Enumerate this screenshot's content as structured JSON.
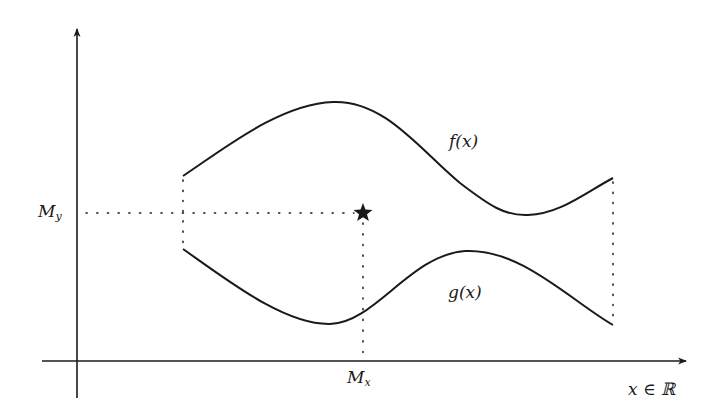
{
  "diagram": {
    "type": "two curves enclosing a region with a marked point",
    "axes": {
      "x_axis_label": "x ∈ ℝ",
      "y_axis_label": ""
    },
    "curves": [
      {
        "name": "f",
        "label": "f(x)",
        "shape": "rises to a maximum, falls to a minimum, then rises"
      },
      {
        "name": "g",
        "label": "g(x)",
        "shape": "falls to a minimum, rises to a maximum, then falls"
      }
    ],
    "point": {
      "marker": "star",
      "x_label_main": "M",
      "x_label_sub": "x",
      "y_label_main": "M",
      "y_label_sub": "y"
    },
    "boundaries": {
      "left": "dotted vertical segment joining g to f at left end",
      "right": "dotted vertical segment joining g to f at right end"
    },
    "colors": {
      "stroke": "#1a1a1a",
      "background": "#ffffff"
    }
  }
}
